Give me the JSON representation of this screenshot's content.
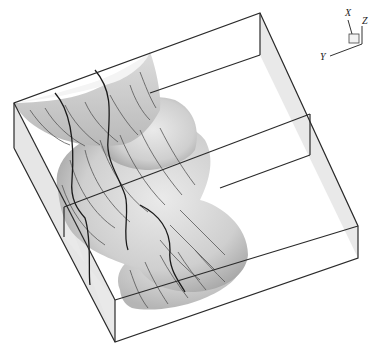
{
  "figure": {
    "type": "3d-isosurface-with-streamlines",
    "axes_triad": {
      "x_label": "X",
      "y_label": "Y",
      "z_label": "Z"
    },
    "colors": {
      "background": "#ffffff",
      "surface_light": "#e4e4e4",
      "surface_mid": "#c2c2c2",
      "surface_dark": "#a8a8a8",
      "box_face": "#e8e8e8",
      "edge": "#2a2a2a",
      "streamline": "#555555"
    }
  }
}
